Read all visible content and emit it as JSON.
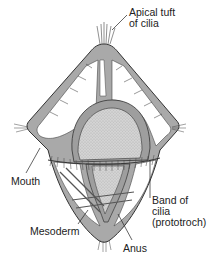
{
  "diagram": {
    "colors": {
      "body_fill": "#a9a9a9",
      "lumen_fill": "#ffffff",
      "gut_fill": "#cfcfcf",
      "outline": "#333333",
      "label_text": "#222222"
    },
    "labels": {
      "apical_tuft_line1": "Apical tuft",
      "apical_tuft_line2": "of cilia",
      "mouth": "Mouth",
      "band_line1": "Band of",
      "band_line2": "cilia",
      "band_line3": "(prototroch)",
      "mesoderm": "Mesoderm",
      "anus": "Anus"
    }
  }
}
